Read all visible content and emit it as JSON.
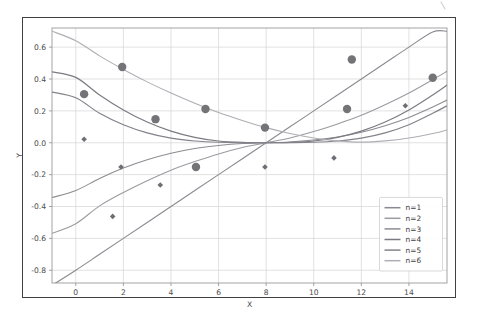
{
  "chart_data": {
    "type": "line",
    "title": "",
    "xlabel": "X",
    "ylabel": "Y",
    "xlim": [
      -1.0,
      15.6
    ],
    "ylim": [
      -0.88,
      0.72
    ],
    "xticks": [
      0,
      2,
      4,
      6,
      8,
      10,
      12,
      14
    ],
    "xticklabels": [
      "0",
      "2",
      "4",
      "6",
      "8",
      "10",
      "12",
      "14"
    ],
    "yticks": [
      0.6,
      0.4,
      0.2,
      0.0,
      -0.2,
      -0.4,
      -0.6,
      -0.8
    ],
    "yticklabels": [
      "0.6",
      "0.4",
      "0.2",
      "0.0",
      "-0.2",
      "-0.4",
      "-0.6",
      "-0.8"
    ],
    "grid": true,
    "legend_position": "lower right",
    "legend_entries": [
      "n=1",
      "n=2",
      "n=3",
      "n=4",
      "n=5",
      "n=6"
    ],
    "convergence_point": [
      8.0,
      0.0
    ],
    "series": [
      {
        "name": "n=1",
        "color": "#8a8a90",
        "linewidth": 1.1,
        "x": [
          -1.0,
          0.0,
          1.0,
          2.0,
          3.0,
          4.0,
          5.0,
          6.0,
          7.0,
          8.0,
          9.0,
          10.0,
          11.0,
          12.0,
          13.0,
          14.0,
          15.0,
          15.6
        ],
        "y": [
          -0.895,
          -0.8,
          -0.7,
          -0.6,
          -0.5,
          -0.4,
          -0.3,
          -0.2,
          -0.1,
          0.0,
          0.1,
          0.2,
          0.3,
          0.4,
          0.5,
          0.6,
          0.695,
          0.7
        ]
      },
      {
        "name": "n=2",
        "color": "#9b9ba1",
        "linewidth": 1.1,
        "x": [
          -1.0,
          0.0,
          1.0,
          2.0,
          3.0,
          4.0,
          5.0,
          6.0,
          7.0,
          8.0,
          9.0,
          10.0,
          11.0,
          12.0,
          13.0,
          14.0,
          15.0,
          15.6
        ],
        "y": [
          -0.568,
          -0.508,
          -0.396,
          -0.312,
          -0.238,
          -0.172,
          -0.118,
          -0.07,
          -0.03,
          0.0,
          0.03,
          0.07,
          0.118,
          0.172,
          0.238,
          0.312,
          0.396,
          0.448
        ]
      },
      {
        "name": "n=3",
        "color": "#8c8c92",
        "linewidth": 1.1,
        "x": [
          -1.0,
          0.0,
          1.0,
          2.0,
          3.0,
          4.0,
          5.0,
          6.0,
          7.0,
          8.0,
          9.0,
          10.0,
          11.0,
          12.0,
          13.0,
          14.0,
          15.0,
          15.6
        ],
        "y": [
          -0.344,
          -0.3,
          -0.224,
          -0.159,
          -0.107,
          -0.066,
          -0.036,
          -0.017,
          -0.005,
          0.0,
          0.005,
          0.017,
          0.036,
          0.066,
          0.107,
          0.159,
          0.224,
          0.268
        ]
      },
      {
        "name": "n=4",
        "color": "#7b7b82",
        "linewidth": 1.2,
        "x": [
          -1.0,
          0.0,
          1.0,
          2.0,
          3.0,
          4.0,
          5.0,
          6.0,
          7.0,
          8.0,
          9.0,
          10.0,
          11.0,
          12.0,
          13.0,
          14.0,
          15.0,
          15.6
        ],
        "y": [
          0.445,
          0.41,
          0.3,
          0.206,
          0.13,
          0.073,
          0.034,
          0.011,
          0.002,
          0.0,
          0.002,
          0.011,
          0.034,
          0.073,
          0.13,
          0.206,
          0.3,
          0.362
        ]
      },
      {
        "name": "n=5",
        "color": "#82828a",
        "linewidth": 1.2,
        "x": [
          -1.0,
          0.0,
          1.0,
          2.0,
          3.0,
          4.0,
          5.0,
          6.0,
          7.0,
          8.0,
          9.0,
          10.0,
          11.0,
          12.0,
          13.0,
          14.0,
          15.0,
          15.6
        ],
        "y": [
          0.318,
          0.282,
          0.185,
          0.113,
          0.062,
          0.029,
          0.011,
          0.003,
          0.0004,
          0.0,
          0.0004,
          0.003,
          0.011,
          0.029,
          0.062,
          0.113,
          0.185,
          0.232
        ]
      },
      {
        "name": "n=6",
        "color": "#aeaeb4",
        "linewidth": 1.1,
        "x": [
          -1.0,
          0.0,
          1.0,
          2.0,
          3.0,
          4.0,
          5.0,
          6.0,
          7.0,
          8.0,
          9.0,
          10.0,
          11.0,
          12.0,
          13.0,
          14.0,
          15.0,
          15.6
        ],
        "y": [
          0.7,
          0.64,
          0.545,
          0.46,
          0.382,
          0.312,
          0.248,
          0.19,
          0.14,
          0.095,
          0.058,
          0.03,
          0.012,
          0.004,
          0.012,
          0.03,
          0.058,
          0.08
        ]
      }
    ],
    "scatter": [
      {
        "name": "circles",
        "marker": "o",
        "color": "#737378",
        "size": 8.4,
        "points": [
          {
            "x": 0.35,
            "y": 0.305
          },
          {
            "x": 1.95,
            "y": 0.475
          },
          {
            "x": 3.35,
            "y": 0.148
          },
          {
            "x": 5.45,
            "y": 0.212
          },
          {
            "x": 5.05,
            "y": -0.152
          },
          {
            "x": 7.95,
            "y": 0.095
          },
          {
            "x": 11.4,
            "y": 0.212
          },
          {
            "x": 11.6,
            "y": 0.522
          },
          {
            "x": 15.0,
            "y": 0.408
          }
        ]
      },
      {
        "name": "diamonds",
        "marker": "D",
        "color": "#6e6e74",
        "size": 5.6,
        "points": [
          {
            "x": 0.35,
            "y": 0.022
          },
          {
            "x": 1.55,
            "y": -0.462
          },
          {
            "x": 1.9,
            "y": -0.152
          },
          {
            "x": 3.55,
            "y": -0.265
          },
          {
            "x": 7.95,
            "y": -0.152
          },
          {
            "x": 10.85,
            "y": -0.095
          },
          {
            "x": 13.85,
            "y": 0.232
          }
        ]
      }
    ]
  },
  "figure": {
    "background_color": "#ffffff",
    "frame_color": "#3f3f44",
    "grid_color": "#d4d4d4",
    "axis_color": "#9a9a9a",
    "tick_text_color": "#4a4a4a"
  }
}
